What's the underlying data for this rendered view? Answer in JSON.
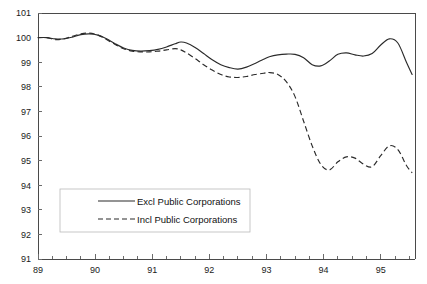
{
  "chart_data": {
    "type": "line",
    "title": "",
    "xlabel": "",
    "ylabel": "",
    "xlim": [
      89.0,
      95.6
    ],
    "ylim": [
      91,
      101
    ],
    "grid": false,
    "legend_position": "bottom-left",
    "x_tick_labels": [
      "89",
      "90",
      "91",
      "92",
      "93",
      "94",
      "95"
    ],
    "x_tick_values": [
      89,
      90,
      91,
      92,
      93,
      94,
      95
    ],
    "y_tick_labels": [
      "91",
      "92",
      "93",
      "94",
      "95",
      "96",
      "97",
      "98",
      "99",
      "100",
      "101"
    ],
    "y_tick_values": [
      91,
      92,
      93,
      94,
      95,
      96,
      97,
      98,
      99,
      100,
      101
    ],
    "minor_x_ticks_per_year": 4,
    "x": [
      89.0,
      89.15,
      89.3,
      89.45,
      89.6,
      89.75,
      89.9,
      90.05,
      90.2,
      90.35,
      90.5,
      90.65,
      90.8,
      90.95,
      91.1,
      91.25,
      91.4,
      91.5,
      91.6,
      91.75,
      91.9,
      92.05,
      92.2,
      92.35,
      92.5,
      92.65,
      92.8,
      92.95,
      93.05,
      93.2,
      93.35,
      93.5,
      93.65,
      93.8,
      93.95,
      94.1,
      94.25,
      94.4,
      94.55,
      94.7,
      94.85,
      95.0,
      95.15,
      95.3,
      95.45,
      95.55
    ],
    "series": [
      {
        "name": "Excl Public Corporations",
        "style": "solid",
        "values": [
          100.0,
          100.0,
          99.95,
          99.95,
          100.02,
          100.12,
          100.15,
          100.1,
          99.95,
          99.75,
          99.58,
          99.48,
          99.45,
          99.47,
          99.52,
          99.62,
          99.75,
          99.82,
          99.78,
          99.6,
          99.35,
          99.1,
          98.9,
          98.78,
          98.72,
          98.8,
          98.95,
          99.12,
          99.22,
          99.3,
          99.33,
          99.32,
          99.18,
          98.9,
          98.85,
          99.05,
          99.32,
          99.38,
          99.3,
          99.25,
          99.35,
          99.7,
          99.95,
          99.78,
          99.0,
          98.5
        ]
      },
      {
        "name": "Incl Public Corporations",
        "style": "dashed",
        "values": [
          100.0,
          100.0,
          99.92,
          99.95,
          100.05,
          100.15,
          100.18,
          100.1,
          99.92,
          99.72,
          99.55,
          99.45,
          99.42,
          99.42,
          99.45,
          99.5,
          99.55,
          99.5,
          99.38,
          99.15,
          98.9,
          98.68,
          98.5,
          98.4,
          98.38,
          98.42,
          98.5,
          98.55,
          98.58,
          98.5,
          98.2,
          97.6,
          96.6,
          95.6,
          94.85,
          94.62,
          94.95,
          95.15,
          95.1,
          94.85,
          94.75,
          95.2,
          95.6,
          95.45,
          94.8,
          94.5
        ]
      }
    ]
  },
  "legend": {
    "entries": [
      {
        "label": "Excl Public Corporations",
        "style": "solid"
      },
      {
        "label": "Incl Public Corporations",
        "style": "dashed"
      }
    ]
  },
  "title_strip": {
    "text": ""
  }
}
